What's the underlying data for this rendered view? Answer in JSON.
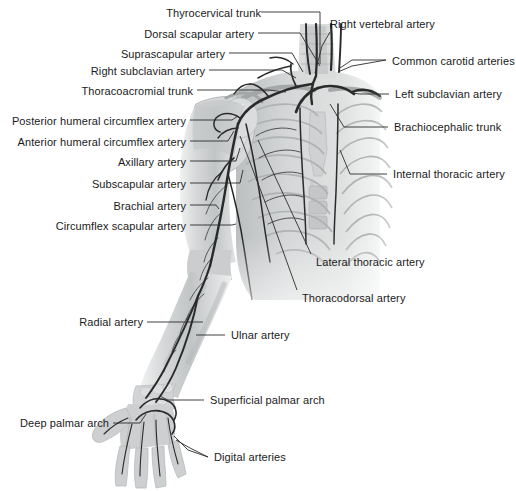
{
  "figure": {
    "background_color": "#ffffff",
    "label_color": "#1a1a1a",
    "leader_color": "#2b2b2b",
    "vessel_color": "#2a2a2a",
    "bone_fill": "#c9cbcc"
  },
  "labels": [
    {
      "id": "thyrocervical-trunk",
      "text": "Thyrocervical trunk",
      "side": "right",
      "x": 163,
      "y": 8,
      "anchor_x": 261,
      "line_to_x": 320,
      "line_to_y": 64
    },
    {
      "id": "dorsal-scapular-artery",
      "text": "Dorsal scapular artery",
      "side": "right",
      "x": 133,
      "y": 29,
      "anchor_x": 258,
      "line_to_x": 312,
      "line_to_y": 70
    },
    {
      "id": "suprascapular-artery",
      "text": "Suprascapular artery",
      "side": "right",
      "x": 106,
      "y": 49,
      "anchor_x": 229,
      "line_to_x": 303,
      "line_to_y": 76
    },
    {
      "id": "right-subclavian-artery",
      "text": "Right subclavian artery",
      "side": "right",
      "x": 85,
      "y": 66,
      "anchor_x": 209,
      "line_to_x": 296,
      "line_to_y": 82
    },
    {
      "id": "thoracoacromial-trunk",
      "text": "Thoracoacromial trunk",
      "side": "right",
      "x": 72,
      "y": 86,
      "anchor_x": 197,
      "line_to_x": 286,
      "line_to_y": 92
    },
    {
      "id": "posterior-humeral-circumflex-artery",
      "text": "Posterior humeral circumflex artery",
      "side": "right",
      "x": 10,
      "y": 116,
      "anchor_x": 190,
      "line_to_x": 238,
      "line_to_y": 113
    },
    {
      "id": "anterior-humeral-circumflex-artery",
      "text": "Anterior humeral circumflex artery",
      "side": "right",
      "x": 14,
      "y": 137,
      "anchor_x": 190,
      "line_to_x": 233,
      "line_to_y": 129
    },
    {
      "id": "axillary-artery",
      "text": "Axillary artery",
      "side": "right",
      "x": 105,
      "y": 157,
      "anchor_x": 190,
      "line_to_x": 240,
      "line_to_y": 147
    },
    {
      "id": "subscapular-artery",
      "text": "Subscapular artery",
      "side": "right",
      "x": 81,
      "y": 179,
      "anchor_x": 190,
      "line_to_x": 243,
      "line_to_y": 168
    },
    {
      "id": "brachial-artery",
      "text": "Brachial artery",
      "side": "right",
      "x": 95,
      "y": 201,
      "anchor_x": 190,
      "line_to_x": 219,
      "line_to_y": 209
    },
    {
      "id": "circumflex-scapular-artery",
      "text": "Circumflex scapular artery",
      "side": "right",
      "x": 36,
      "y": 221,
      "anchor_x": 190,
      "line_to_x": 234,
      "line_to_y": 225
    },
    {
      "id": "radial-artery",
      "text": "Radial artery",
      "side": "right",
      "x": 78,
      "y": 318,
      "anchor_x": 147,
      "line_to_x": 203,
      "line_to_y": 318
    },
    {
      "id": "deep-palmar-arch",
      "text": "Deep palmar arch",
      "side": "right",
      "x": 19,
      "y": 419,
      "anchor_x": 113,
      "line_to_x": 146,
      "line_to_y": 412
    },
    {
      "id": "right-vertebral-artery",
      "text": "Right vertebral artery",
      "side": "left",
      "x": 330,
      "y": 19,
      "anchor_x": 330,
      "line_to_x": 315,
      "line_to_y": 73
    },
    {
      "id": "common-carotid-arteries",
      "text": "Common carotid arteries",
      "side": "left",
      "x": 390,
      "y": 56,
      "anchor_x": 386,
      "line_to_x": 340,
      "line_to_y": 69
    },
    {
      "id": "left-subclavian-artery",
      "text": "Left subclavian artery",
      "side": "left",
      "x": 393,
      "y": 90,
      "anchor_x": 389,
      "line_to_x": 355,
      "line_to_y": 94
    },
    {
      "id": "brachiocephalic-trunk",
      "text": "Brachiocephalic trunk",
      "side": "left",
      "x": 392,
      "y": 123,
      "anchor_x": 388,
      "line_to_x": 331,
      "line_to_y": 104
    },
    {
      "id": "internal-thoracic-artery",
      "text": "Internal thoracic artery",
      "side": "left",
      "x": 391,
      "y": 170,
      "anchor_x": 387,
      "line_to_x": 342,
      "line_to_y": 150
    },
    {
      "id": "lateral-thoracic-artery",
      "text": "Lateral thoracic artery",
      "side": "left",
      "x": 314,
      "y": 258,
      "anchor_x": 311,
      "line_to_x": 258,
      "line_to_y": 140
    },
    {
      "id": "thoracodorsal-artery",
      "text": "Thoracodorsal artery",
      "side": "left",
      "x": 301,
      "y": 294,
      "anchor_x": 297,
      "line_to_x": 238,
      "line_to_y": 135
    },
    {
      "id": "ulnar-artery",
      "text": "Ulnar artery",
      "side": "left",
      "x": 229,
      "y": 331,
      "anchor_x": 225,
      "line_to_x": 196,
      "line_to_y": 331
    },
    {
      "id": "superficial-palmar-arch",
      "text": "Superficial palmar arch",
      "side": "left",
      "x": 208,
      "y": 396,
      "anchor_x": 204,
      "line_to_x": 160,
      "line_to_y": 398
    },
    {
      "id": "digital-arteries",
      "text": "Digital arteries",
      "side": "left",
      "x": 212,
      "y": 453,
      "anchor_x": 208,
      "line_to_x": 172,
      "line_to_y": 438
    }
  ]
}
